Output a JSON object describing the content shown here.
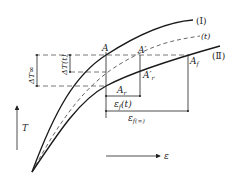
{
  "diagram": {
    "curves": [
      {
        "id": "I",
        "label": "(Ⅰ)",
        "style": "solid"
      },
      {
        "id": "t",
        "label": "(t)",
        "style": "dashed"
      },
      {
        "id": "II",
        "label": "(Ⅱ)",
        "style": "solid"
      }
    ],
    "points": {
      "A": "A",
      "A_prime": "A′",
      "A_f": "A",
      "A_f_sub": "f",
      "A_r": "A",
      "A_r_sub": "r",
      "A_r_prime": "A′",
      "A_r_prime_sub": "r"
    },
    "dimensions": {
      "delta_T_inf": "ΔT∞",
      "delta_T_t": "ΔT(t)",
      "eps_f_t_main": "ε",
      "eps_f_t_sub": "f",
      "eps_f_t_arg": "(t)",
      "eps_f_inf_main": "ε",
      "eps_f_inf_sub": "f(∞)"
    },
    "axes": {
      "y_label": "T",
      "x_label": "ε"
    },
    "colors": {
      "line": "#1a1a1a",
      "dashed": "#555555"
    }
  }
}
